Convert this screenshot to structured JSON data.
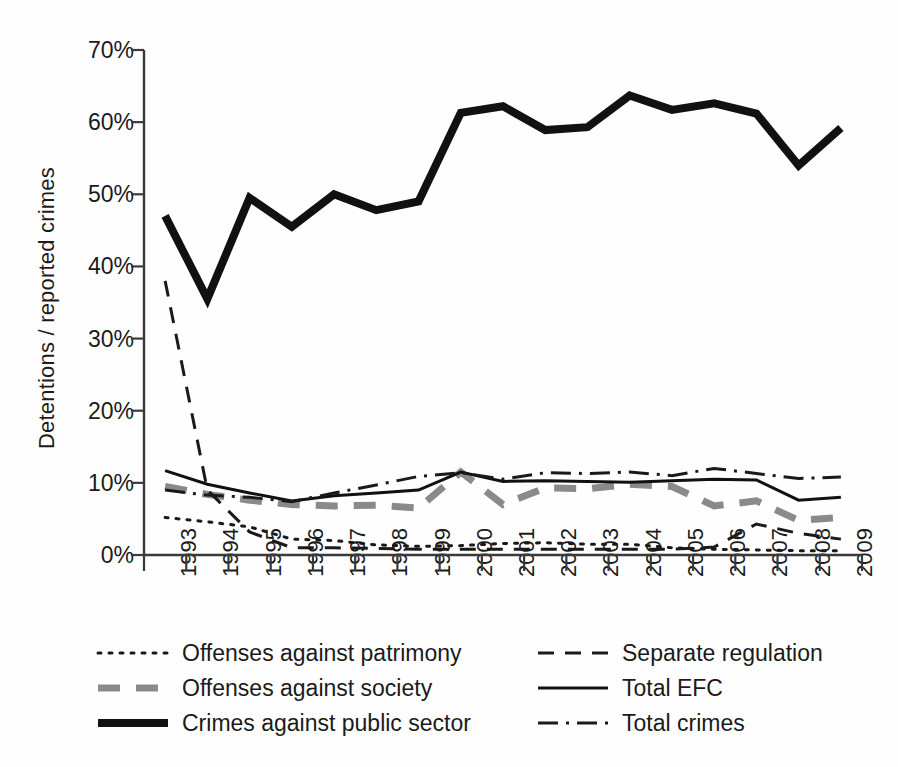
{
  "chart_data": {
    "type": "line",
    "title": "",
    "xlabel": "",
    "ylabel": "Detentions / reported crimes",
    "categories": [
      "1993",
      "1994",
      "1995",
      "1996",
      "1997",
      "1998",
      "1999",
      "2000",
      "2001",
      "2002",
      "2003",
      "2004",
      "2005",
      "2006",
      "2007",
      "2008",
      "2009"
    ],
    "x": [
      1993,
      1994,
      1995,
      1996,
      1997,
      1998,
      1999,
      2000,
      2001,
      2002,
      2003,
      2004,
      2005,
      2006,
      2007,
      2008,
      2009
    ],
    "ylim": [
      0,
      70
    ],
    "yticks": [
      "0%",
      "10%",
      "20%",
      "30%",
      "40%",
      "50%",
      "60%",
      "70%"
    ],
    "ytick_values": [
      0,
      10,
      20,
      30,
      40,
      50,
      60,
      70
    ],
    "grid": false,
    "legend_position": "below-plot",
    "series": [
      {
        "name": "Offenses against patrimony",
        "style": "dotted",
        "color": "#1a1a1a",
        "width": 3,
        "values": [
          5.2,
          4.6,
          3.9,
          2.2,
          2.0,
          1.4,
          1.2,
          1.3,
          1.6,
          1.7,
          1.5,
          1.5,
          1.0,
          0.8,
          0.7,
          0.6,
          0.6
        ]
      },
      {
        "name": "Offenses against society",
        "style": "dashed-thick-gray",
        "color": "#8a8a8a",
        "width": 7,
        "values": [
          9.5,
          8.4,
          7.6,
          7.0,
          6.8,
          6.9,
          6.5,
          11.5,
          7.0,
          9.3,
          9.2,
          9.8,
          9.5,
          6.8,
          7.5,
          4.8,
          5.2
        ]
      },
      {
        "name": "Crimes against public sector",
        "style": "solid-thick",
        "color": "#111111",
        "width": 8,
        "values": [
          47.0,
          35.5,
          49.5,
          45.5,
          50.0,
          47.8,
          49.0,
          61.3,
          62.2,
          58.9,
          59.3,
          63.7,
          61.7,
          62.6,
          61.2,
          54.0,
          59.2
        ]
      },
      {
        "name": "Separate regulation",
        "style": "dashed",
        "color": "#1a1a1a",
        "width": 3,
        "values": [
          38.0,
          9.0,
          3.2,
          1.0,
          1.0,
          0.9,
          0.8,
          0.8,
          0.8,
          0.8,
          0.8,
          0.8,
          0.8,
          1.1,
          4.3,
          3.0,
          2.2
        ]
      },
      {
        "name": "Total EFC",
        "style": "solid-thin",
        "color": "#111111",
        "width": 3,
        "values": [
          11.7,
          9.8,
          8.6,
          7.5,
          8.2,
          8.6,
          9.0,
          11.5,
          10.2,
          10.3,
          10.2,
          10.1,
          10.3,
          10.5,
          10.4,
          7.6,
          8.0
        ]
      },
      {
        "name": "Total crimes",
        "style": "dash-dot",
        "color": "#1a1a1a",
        "width": 3,
        "values": [
          9.0,
          8.3,
          8.0,
          7.4,
          8.6,
          9.7,
          10.9,
          11.4,
          10.5,
          11.4,
          11.3,
          11.5,
          11.0,
          12.0,
          11.3,
          10.6,
          10.8
        ]
      }
    ]
  },
  "legend": {
    "items": [
      {
        "label": "Offenses against patrimony",
        "style": "dotted",
        "color": "#1a1a1a",
        "column": 0,
        "row": 0
      },
      {
        "label": "Offenses against society",
        "style": "dashed-thick-gray",
        "color": "#8a8a8a",
        "column": 0,
        "row": 1
      },
      {
        "label": "Crimes against public sector",
        "style": "solid-thick",
        "color": "#111111",
        "column": 0,
        "row": 2
      },
      {
        "label": "Separate regulation",
        "style": "dashed",
        "color": "#1a1a1a",
        "column": 1,
        "row": 0
      },
      {
        "label": "Total EFC",
        "style": "solid-thin",
        "color": "#111111",
        "column": 1,
        "row": 1
      },
      {
        "label": "Total crimes",
        "style": "dash-dot",
        "color": "#1a1a1a",
        "column": 1,
        "row": 2
      }
    ]
  },
  "caption_fragment": ""
}
